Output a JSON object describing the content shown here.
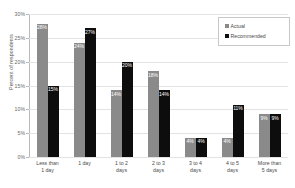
{
  "chart_data": {
    "type": "bar",
    "title": "",
    "xlabel": "",
    "ylabel": "Percent of respondents",
    "ylim": [
      0,
      30
    ],
    "ytick_labels": [
      "0%",
      "5%",
      "10%",
      "15%",
      "20%",
      "25%",
      "30%"
    ],
    "ytick_values": [
      0,
      5,
      10,
      15,
      20,
      25,
      30
    ],
    "grid": true,
    "legend_position": "top-right",
    "categories": [
      "Less than\n1 day",
      "1 day",
      "1 to 2\ndays",
      "2 to 3\ndays",
      "3 to 4\ndays",
      "4 to 5\ndays",
      "More than\n5 days"
    ],
    "series": [
      {
        "name": "Actual",
        "color": "#8a8a8a",
        "values": [
          28,
          24,
          14,
          18,
          4,
          4,
          9
        ],
        "labels": [
          "28%",
          "24%",
          "14%",
          "18%",
          "4%",
          "4%",
          "9%"
        ]
      },
      {
        "name": "Recommended",
        "color": "#0d0d0d",
        "values": [
          15,
          27,
          20,
          14,
          4,
          11,
          9
        ],
        "labels": [
          "15%",
          "27%",
          "20%",
          "14%",
          "4%",
          "11%",
          "9%"
        ]
      }
    ]
  },
  "legend": {
    "entries": [
      {
        "label": "Actual",
        "color": "#8a8a8a"
      },
      {
        "label": "Recommended",
        "color": "#0d0d0d"
      }
    ]
  },
  "axes": {
    "y_title": "Percent of respondents"
  }
}
